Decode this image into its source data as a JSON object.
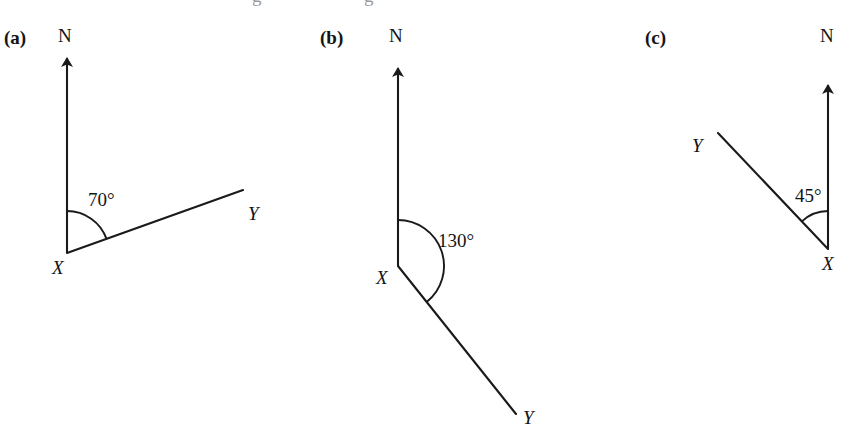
{
  "figure": {
    "background_color": "#ffffff",
    "stroke_color": "#1a1a1a",
    "text_color": "#141414",
    "width": 851,
    "height": 439,
    "clipped_text_top": "g"
  },
  "diagrams": [
    {
      "id": "a",
      "part_label": "(a)",
      "part_label_pos": {
        "x": 4,
        "y": 28
      },
      "north_label": "N",
      "north_label_pos": {
        "x": 58,
        "y": 26
      },
      "vertex_label": "X",
      "vertex_label_pos": {
        "x": 52,
        "y": 258
      },
      "ray_label": "Y",
      "ray_label_pos": {
        "x": 248,
        "y": 204
      },
      "angle_label": "70°",
      "angle_value": 70,
      "angle_label_pos": {
        "x": 88,
        "y": 190
      },
      "vertex": {
        "x": 67,
        "y": 253
      },
      "north_tip": {
        "x": 67,
        "y": 58
      },
      "ray_end": {
        "x": 243,
        "y": 190
      },
      "arc_radius": 42,
      "bearing_from": "north",
      "bearing_direction": "clockwise"
    },
    {
      "id": "b",
      "part_label": "(b)",
      "part_label_pos": {
        "x": 320,
        "y": 28
      },
      "north_label": "N",
      "north_label_pos": {
        "x": 389,
        "y": 26
      },
      "vertex_label": "X",
      "vertex_label_pos": {
        "x": 376,
        "y": 268
      },
      "ray_label": "Y",
      "ray_label_pos": {
        "x": 523,
        "y": 408
      },
      "angle_label": "130°",
      "angle_value": 130,
      "angle_label_pos": {
        "x": 438,
        "y": 231
      },
      "vertex": {
        "x": 398,
        "y": 266
      },
      "north_tip": {
        "x": 398,
        "y": 68
      },
      "ray_end": {
        "x": 516,
        "y": 414
      },
      "arc_radius": 46,
      "bearing_from": "north",
      "bearing_direction": "clockwise"
    },
    {
      "id": "c",
      "part_label": "(c)",
      "part_label_pos": {
        "x": 645,
        "y": 28
      },
      "north_label": "N",
      "north_label_pos": {
        "x": 820,
        "y": 26
      },
      "vertex_label": "X",
      "vertex_label_pos": {
        "x": 822,
        "y": 254
      },
      "ray_label": "Y",
      "ray_label_pos": {
        "x": 692,
        "y": 136
      },
      "angle_label": "45°",
      "angle_value": 45,
      "angle_label_pos": {
        "x": 795,
        "y": 186
      },
      "vertex": {
        "x": 828,
        "y": 249
      },
      "north_tip": {
        "x": 828,
        "y": 85
      },
      "ray_end": {
        "x": 718,
        "y": 133
      },
      "arc_radius": 38,
      "bearing_from": "north",
      "bearing_direction": "anticlockwise"
    }
  ]
}
